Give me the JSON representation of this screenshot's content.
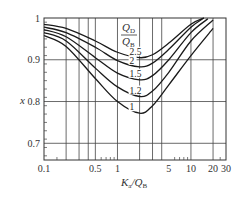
{
  "chart_data": {
    "type": "line",
    "title": "",
    "xlabel": "K_a/Q_B",
    "ylabel": "x",
    "xscale": "log",
    "xlim": [
      0.1,
      30
    ],
    "ylim": [
      0.66,
      1.0
    ],
    "x_ticks": [
      0.1,
      0.5,
      1,
      5,
      10,
      20,
      30
    ],
    "x_tick_labels": [
      "0.1",
      "0.5",
      "1",
      "5",
      "10",
      "20",
      "30"
    ],
    "x_gridlines": [
      0.2,
      0.3,
      0.4,
      0.5,
      1,
      2,
      3,
      4,
      10,
      20
    ],
    "y_ticks": [
      0.7,
      0.8,
      0.9,
      1
    ],
    "y_tick_labels": [
      "0.7",
      "0.8",
      "0.9",
      "1"
    ],
    "y_gridlines": [
      0.7,
      0.8,
      0.9
    ],
    "grid": true,
    "legend_title": "Q_D/Q_B",
    "legend_position": "inline, above curve minima near K_a/Q_B≈2",
    "series": [
      {
        "name": "2.5",
        "x": [
          0.1,
          0.2,
          0.5,
          1,
          2,
          3,
          5,
          10,
          15
        ],
        "values": [
          0.985,
          0.975,
          0.945,
          0.918,
          0.905,
          0.912,
          0.94,
          0.985,
          1.0
        ]
      },
      {
        "name": "2",
        "x": [
          0.1,
          0.2,
          0.5,
          1,
          2,
          3,
          5,
          10,
          15
        ],
        "values": [
          0.978,
          0.965,
          0.93,
          0.898,
          0.883,
          0.892,
          0.925,
          0.978,
          1.0
        ]
      },
      {
        "name": "1.5",
        "x": [
          0.1,
          0.2,
          0.5,
          1,
          2,
          3,
          5,
          10,
          17
        ],
        "values": [
          0.972,
          0.955,
          0.905,
          0.868,
          0.852,
          0.862,
          0.9,
          0.965,
          0.998
        ]
      },
      {
        "name": "1.2",
        "x": [
          0.1,
          0.2,
          0.5,
          1,
          2,
          3,
          5,
          10,
          20
        ],
        "values": [
          0.965,
          0.945,
          0.88,
          0.835,
          0.812,
          0.825,
          0.87,
          0.945,
          0.995
        ]
      },
      {
        "name": "1",
        "x": [
          0.1,
          0.2,
          0.5,
          1,
          2,
          3,
          5,
          10,
          20
        ],
        "values": [
          0.958,
          0.932,
          0.855,
          0.8,
          0.772,
          0.79,
          0.84,
          0.91,
          0.975
        ]
      }
    ]
  },
  "labels": {
    "ylabel": "x",
    "xlabel_main": "K",
    "xlabel_sub1": "a",
    "xlabel_slash": "/Q",
    "xlabel_sub2": "B",
    "legend_num_main": "Q",
    "legend_num_sub": "D",
    "legend_den_main": "Q",
    "legend_den_sub": "B"
  }
}
